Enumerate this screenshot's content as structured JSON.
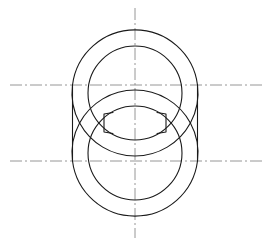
{
  "drawing": {
    "title": "Two Overlapping Annular Rings - Orthographic View",
    "description": "Engineering line drawing of two interlocking ring / chain-link shapes shown with construction centerlines",
    "canvas": {
      "width": 275,
      "height": 246,
      "background": "#ffffff"
    },
    "style": {
      "object_line_color": "#1a1a1a",
      "object_line_width": 1.1,
      "center_line_color": "#8a8a8a",
      "center_line_width": 0.9,
      "center_line_dash": "12 3 2 3"
    },
    "geometry": {
      "upper_ring": {
        "name": "upper-ring",
        "center_x": 135,
        "center_y": 93,
        "outer_radius": 63,
        "inner_radius": 47
      },
      "lower_ring": {
        "name": "lower-ring",
        "center_x": 135,
        "center_y": 153,
        "outer_radius": 63,
        "inner_radius": 47
      },
      "tangent_lines": {
        "left_x": 72.5,
        "right_x": 197.5,
        "top_y": 85,
        "bottom_y": 161
      },
      "notches": {
        "left_x": 104,
        "right_x": 166,
        "top_y": 113,
        "bottom_y": 133,
        "depth": 9
      }
    },
    "centerlines": {
      "vertical": {
        "label": "vertical-centerline",
        "x": 135,
        "y_start": 8,
        "y_end": 238
      },
      "horizontal_upper": {
        "label": "upper-horizontal-centerline",
        "y": 85,
        "x_start": 10,
        "x_end": 265
      },
      "horizontal_lower": {
        "label": "lower-horizontal-centerline",
        "y": 161,
        "x_start": 10,
        "x_end": 265
      }
    },
    "artifact": {
      "corner_mark": ""
    }
  }
}
